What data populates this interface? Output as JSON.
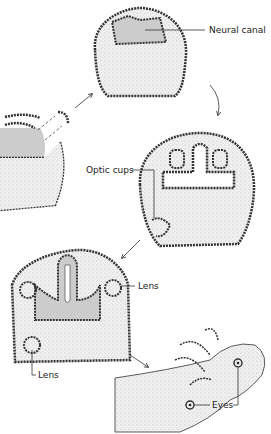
{
  "labels": {
    "neural_canal": "Neural canal",
    "optic_cups": "Optic cups",
    "lens_right": "Lens",
    "lens_left": "Lens",
    "eyes": "Eyes"
  },
  "stages": [
    {
      "id": 1,
      "name": "neural-fold-section (partial)"
    },
    {
      "id": 2,
      "name": "neural-canal-section"
    },
    {
      "id": 3,
      "name": "optic-cup-section"
    },
    {
      "id": 4,
      "name": "lens-formation-section"
    },
    {
      "id": 5,
      "name": "larva-with-eyes"
    }
  ],
  "colors": {
    "stroke": "#333333",
    "fill_stipple": "#e6e6e6",
    "canal": "#d0d0d0"
  }
}
